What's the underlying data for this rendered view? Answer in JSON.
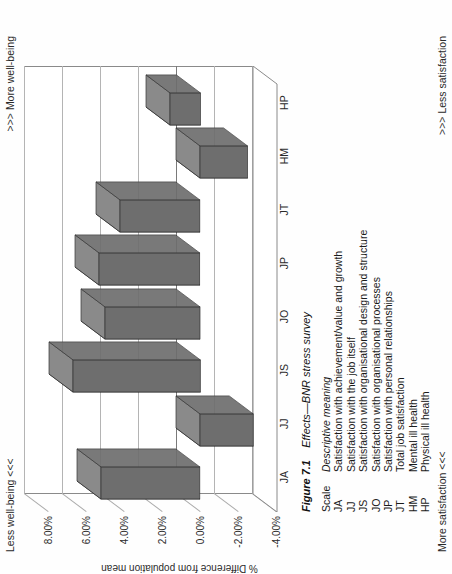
{
  "figure": {
    "number": "Figure 7.1",
    "caption": "Effects—BNR stress survey"
  },
  "annotations": {
    "top_left": "Less well-being <<<",
    "top_right": ">>> More well-being",
    "bottom_left": "More satisfaction <<<",
    "bottom_right": ">>> Less satisfaction"
  },
  "legend": {
    "header_scale": "Scale",
    "header_descriptive": "Descriptive meaning",
    "rows": [
      {
        "abbr": "JA",
        "meaning": "Satisfaction with achievement/value and growth"
      },
      {
        "abbr": "JJ",
        "meaning": "Satisfaction with the job itself"
      },
      {
        "abbr": "JS",
        "meaning": "Satisfaction with organisational design and structure"
      },
      {
        "abbr": "JO",
        "meaning": "Satisfaction with organisational processes"
      },
      {
        "abbr": "JP",
        "meaning": "Satisfaction with personal relationships"
      },
      {
        "abbr": "JT",
        "meaning": "Total job satisfaction"
      },
      {
        "abbr": "HM",
        "meaning": "Mental ill health"
      },
      {
        "abbr": "HP",
        "meaning": "Physical ill health"
      }
    ]
  },
  "chart_data": {
    "type": "bar",
    "title": "Effects—BNR stress survey",
    "xlabel": "",
    "ylabel": "% Difference from population mean",
    "categories": [
      "JA",
      "JJ",
      "JS",
      "JO",
      "JP",
      "JT",
      "HM",
      "HP"
    ],
    "values": [
      5.2,
      -2.8,
      6.7,
      5.0,
      5.3,
      4.2,
      -2.5,
      1.6
    ],
    "ylim": [
      -4.0,
      8.0
    ],
    "yticks": [
      8.0,
      6.0,
      4.0,
      2.0,
      0.0,
      -2.0,
      -4.0
    ],
    "ytick_labels": [
      "8.00%",
      "6.00%",
      "4.00%",
      "2.00%",
      "0.00%",
      "-2.00%",
      "-4.00%"
    ],
    "grid": true,
    "legend_position": "none",
    "orientation": "vertical-3d",
    "bar_color": "#6e6e6e",
    "bar_top_color": "#8a8a8a",
    "bar_side_color": "#1d1d1d",
    "axis_color": "#7a7a7a",
    "grid_color": "#b4b4b4"
  }
}
